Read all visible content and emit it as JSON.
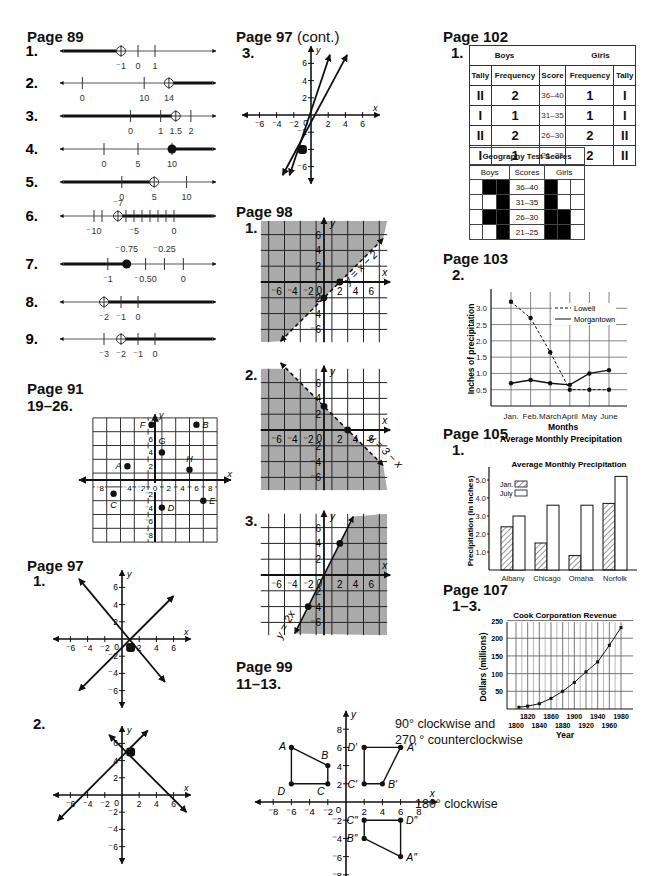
{
  "col1": {
    "page89": {
      "title": "Page 89",
      "items": [
        {
          "label": "1.",
          "y": 51,
          "min": -4,
          "max": 4,
          "x0": 60,
          "x1": 216,
          "ticks": [
            {
              "v": -1,
              "t": "⁻1"
            },
            {
              "v": 0,
              "t": "0"
            },
            {
              "v": 1,
              "t": "1"
            }
          ],
          "point": -1,
          "closed": false,
          "dir": "left"
        },
        {
          "label": "2.",
          "y": 83,
          "min": -2,
          "max": 20,
          "x0": 60,
          "x1": 216,
          "ticks": [
            {
              "v": 0,
              "t": "0"
            },
            {
              "v": 10,
              "t": "10"
            },
            {
              "v": 14,
              "t": "14"
            }
          ],
          "point": 14,
          "closed": false,
          "dir": "right"
        },
        {
          "label": "3.",
          "y": 116,
          "min": -2,
          "max": 2.5,
          "x0": 60,
          "x1": 216,
          "ticks": [
            {
              "v": 0,
              "t": "0"
            },
            {
              "v": 1,
              "t": "1"
            },
            {
              "v": 1.5,
              "t": "1.5"
            },
            {
              "v": 2,
              "t": "2"
            }
          ],
          "point": 1.5,
          "closed": false,
          "dir": "left"
        },
        {
          "label": "4.",
          "y": 149,
          "min": -5,
          "max": 15,
          "x0": 60,
          "x1": 216,
          "ticks": [
            {
              "v": 0,
              "t": "0"
            },
            {
              "v": 5,
              "t": "5"
            },
            {
              "v": 10,
              "t": "10"
            }
          ],
          "point": 10,
          "closed": true,
          "dir": "right"
        },
        {
          "label": "5.",
          "y": 182,
          "min": -8,
          "max": 13,
          "x0": 60,
          "x1": 216,
          "ticks": [
            {
              "v": 0,
              "t": "0"
            },
            {
              "v": 5,
              "t": "5"
            },
            {
              "v": 10,
              "t": "10"
            }
          ],
          "point": 5,
          "closed": false,
          "dir": "left"
        },
        {
          "label": "6.",
          "y": 216,
          "min": -13,
          "max": 4,
          "x0": 60,
          "x1": 216,
          "ticks": [
            {
              "v": -10,
              "t": "⁻10"
            },
            {
              "v": -9,
              "t": ""
            },
            {
              "v": -7,
              "t": ""
            },
            {
              "v": -6,
              "t": ""
            },
            {
              "v": -5,
              "t": "⁻5"
            },
            {
              "v": -4,
              "t": ""
            },
            {
              "v": -3,
              "t": ""
            },
            {
              "v": -2,
              "t": ""
            },
            {
              "v": -1,
              "t": ""
            },
            {
              "v": 0,
              "t": "0"
            }
          ],
          "point": -7,
          "pointLabel": "⁻7",
          "closed": false,
          "dir": "right"
        },
        {
          "label": "7.",
          "y": 264,
          "min": -1.5,
          "max": 0.3,
          "x0": 60,
          "x1": 216,
          "ticks": [
            {
              "v": -1,
              "t": "⁻1"
            },
            {
              "v": -0.5,
              "t": "⁻0.50"
            },
            {
              "v": -0.25,
              "t": ""
            },
            {
              "v": 0,
              "t": "0"
            }
          ],
          "above": [
            {
              "v": -0.75,
              "t": "⁻0.75"
            },
            {
              "v": -0.25,
              "t": "⁻0.25"
            }
          ],
          "point": -0.75,
          "closed": true,
          "dir": "left"
        },
        {
          "label": "8.",
          "y": 302,
          "min": -4,
          "max": 4,
          "x0": 60,
          "x1": 216,
          "ticks": [
            {
              "v": -2,
              "t": "⁻2"
            },
            {
              "v": -1,
              "t": "⁻1"
            },
            {
              "v": 0,
              "t": "0"
            }
          ],
          "point": -2,
          "closed": false,
          "dir": "right"
        },
        {
          "label": "9.",
          "y": 339,
          "min": -5,
          "max": 3,
          "x0": 60,
          "x1": 216,
          "ticks": [
            {
              "v": -3,
              "t": "⁻3"
            },
            {
              "v": -2,
              "t": "⁻2"
            },
            {
              "v": -1,
              "t": "⁻1"
            },
            {
              "v": 0,
              "t": "0"
            }
          ],
          "point": -2,
          "closed": false,
          "dir": "right"
        }
      ]
    },
    "page91": {
      "title": "Page 91",
      "sub": "19–26.",
      "points": [
        {
          "n": "A",
          "x": -4,
          "y": 2,
          "lx": -1,
          "ly": 0
        },
        {
          "n": "B",
          "x": 6,
          "y": 8,
          "lx": 1,
          "ly": 0
        },
        {
          "n": "C",
          "x": -6,
          "y": -2,
          "lx": 0,
          "ly": 1
        },
        {
          "n": "D",
          "x": 1,
          "y": -4,
          "lx": 1,
          "ly": 0
        },
        {
          "n": "E",
          "x": 7,
          "y": -3,
          "lx": 1,
          "ly": 0
        },
        {
          "n": "F",
          "x": -0.5,
          "y": 8,
          "lx": -1,
          "ly": 0
        },
        {
          "n": "G",
          "x": 1,
          "y": 4,
          "lx": 0,
          "ly": -1
        },
        {
          "n": "H",
          "x": 5,
          "y": 1.5,
          "lx": 0,
          "ly": -1
        }
      ],
      "xticks": [
        "⁻8",
        "⁻4",
        "⁻2",
        "0",
        "2",
        "4",
        "6",
        "8"
      ],
      "yticks": [
        "8",
        "6",
        "4",
        "2",
        "⁻2",
        "⁻4",
        "⁻6",
        "⁻8"
      ]
    },
    "page97": {
      "title": "Page 97",
      "graphs": [
        {
          "label": "1.",
          "lines": [
            [
              -5,
              7,
              5,
              -5
            ],
            [
              -5,
              -6,
              6,
              5
            ]
          ],
          "dot": [
            1,
            -1
          ]
        },
        {
          "label": "2.",
          "lines": [
            [
              -1.5,
              7,
              7.5,
              -2
            ],
            [
              -7.5,
              -3,
              3,
              7.5
            ]
          ],
          "dot": [
            1,
            5
          ]
        }
      ]
    }
  },
  "col2": {
    "page97cont": {
      "title": "Page 97",
      "cont": "(cont.)",
      "label": "3.",
      "lines": [
        [
          -2.5,
          -7,
          2.2,
          7
        ],
        [
          -3.3,
          -7,
          4.2,
          7
        ]
      ],
      "dot": [
        -1,
        -4
      ]
    },
    "page98": {
      "title": "Page 98",
      "graphs": [
        {
          "label": "1.",
          "eq": "y = x − 2",
          "shade": "above",
          "line": [
            -5.5,
            -7.5,
            7.5,
            5.5
          ],
          "dots": [
            [
              0,
              -2
            ],
            [
              2,
              0
            ]
          ]
        },
        {
          "label": "2.",
          "eq": "y = 3 − x",
          "shade": "below",
          "line": [
            -5.5,
            8.5,
            7.5,
            -4.5
          ],
          "dots": [
            [
              0,
              3
            ],
            [
              3,
              0
            ]
          ]
        },
        {
          "label": "3.",
          "eq": "y = 2x",
          "shade": "right",
          "line": [
            -3.7,
            -7.4,
            3.7,
            7.4
          ],
          "dots": [
            [
              2,
              4
            ],
            [
              -2,
              -4
            ]
          ]
        }
      ]
    },
    "page99": {
      "title": "Page 99",
      "sub": "11–13.",
      "shapes": [
        {
          "pts": [
            [
              -6,
              6,
              "A"
            ],
            [
              -2,
              4,
              "B"
            ],
            [
              -2,
              2,
              "C"
            ],
            [
              -6,
              2,
              "D"
            ]
          ]
        },
        {
          "pts": [
            [
              6,
              6,
              "A′"
            ],
            [
              4,
              2,
              "B′"
            ],
            [
              2,
              2,
              "C′"
            ],
            [
              2,
              6,
              "D′"
            ]
          ]
        },
        {
          "pts": [
            [
              6,
              -6,
              "A″"
            ],
            [
              2,
              -4,
              "B″"
            ],
            [
              2,
              -2,
              "C″"
            ],
            [
              6,
              -2,
              "D″"
            ]
          ]
        }
      ],
      "note1a": "90° clockwise and",
      "note1b": "270 ° counterclockwise",
      "note2": "180° clockwise"
    }
  },
  "col3": {
    "page102": {
      "title": "Page 102",
      "label": "1.",
      "boys": "Boys",
      "girls": "Girls",
      "headers": [
        "Tally",
        "Frequency",
        "Score",
        "Frequency",
        "Tally"
      ],
      "rows": [
        [
          "II",
          "2",
          "36–40",
          "1",
          "I"
        ],
        [
          "I",
          "1",
          "31–35",
          "1",
          "I"
        ],
        [
          "II",
          "2",
          "26–30",
          "2",
          "II"
        ],
        [
          "I",
          "1",
          "21–25",
          "2",
          "II"
        ]
      ],
      "geo": {
        "title": "Geography Test Scores",
        "boys": "Boys",
        "scores": "Scores",
        "girls": "Girls",
        "rows": [
          {
            "score": "36–40",
            "b": [
              0,
              1,
              1
            ],
            "g": [
              1,
              0,
              0
            ]
          },
          {
            "score": "31–35",
            "b": [
              0,
              0,
              1
            ],
            "g": [
              1,
              0,
              0
            ]
          },
          {
            "score": "26–30",
            "b": [
              0,
              1,
              1
            ],
            "g": [
              1,
              1,
              0
            ]
          },
          {
            "score": "21–25",
            "b": [
              0,
              0,
              1
            ],
            "g": [
              1,
              1,
              0
            ]
          }
        ]
      }
    },
    "page103": {
      "title": "Page 103",
      "label": "2."
    },
    "page105": {
      "title": "Page 105",
      "label": "1."
    },
    "page107": {
      "title": "Page 107",
      "label": "1–3."
    }
  },
  "chart_data": [
    {
      "type": "line",
      "title": "Average Monthly Precipitation",
      "xlabel": "Months",
      "ylabel": "Inches of precipitation",
      "categories": [
        "Jan.",
        "Feb.",
        "March",
        "April",
        "May",
        "June"
      ],
      "series": [
        {
          "name": "Lowell",
          "style": "dashed",
          "values": [
            3.2,
            2.7,
            1.65,
            0.5,
            0.5,
            0.5
          ]
        },
        {
          "name": "Morgantown",
          "style": "solid",
          "values": [
            0.7,
            0.8,
            0.7,
            0.65,
            1.0,
            1.1
          ]
        }
      ],
      "yticks": [
        "0.5",
        "1.0",
        "1.5",
        "2.0",
        "2.5",
        "3.0"
      ],
      "ylim": [
        0,
        3.5
      ],
      "grid": true,
      "legend": "top-right"
    },
    {
      "type": "bar",
      "title": "Average Monthly Precipitation",
      "xlabel": "",
      "ylabel": "Precipitation (in inches)",
      "categories": [
        "Albany",
        "Chicago",
        "Omaha",
        "Norfolk"
      ],
      "series": [
        {
          "name": "Jan.",
          "pattern": "hatched",
          "values": [
            2.4,
            1.5,
            0.8,
            3.7
          ]
        },
        {
          "name": "July",
          "pattern": "white",
          "values": [
            3.0,
            3.6,
            3.6,
            5.2
          ]
        }
      ],
      "yticks": [
        "1.0",
        "2.0",
        "3.0",
        "4.0",
        "5.0"
      ],
      "ylim": [
        0,
        6
      ],
      "legend": "top-left"
    },
    {
      "type": "line",
      "title": "Cook Corporation Revenue",
      "xlabel": "Year",
      "ylabel": "Dollars (millions)",
      "x": [
        1800,
        1810,
        1820,
        1830,
        1840,
        1850,
        1860,
        1870,
        1880,
        1890,
        1900,
        1910,
        1920,
        1930,
        1940,
        1950,
        1960,
        1970,
        1980
      ],
      "xticks_top": [
        "1820",
        "1860",
        "1900",
        "1940",
        "1980"
      ],
      "xticks_bottom": [
        "1800",
        "1840",
        "1880",
        "1920",
        "1960"
      ],
      "points": [
        [
          1805,
          5
        ],
        [
          1820,
          8
        ],
        [
          1840,
          15
        ],
        [
          1860,
          30
        ],
        [
          1880,
          50
        ],
        [
          1900,
          75
        ],
        [
          1920,
          105
        ],
        [
          1940,
          133
        ],
        [
          1960,
          180
        ],
        [
          1980,
          230
        ]
      ],
      "yticks": [
        "50",
        "100",
        "150",
        "200",
        "250"
      ],
      "ylim": [
        0,
        260
      ],
      "grid": true
    }
  ]
}
